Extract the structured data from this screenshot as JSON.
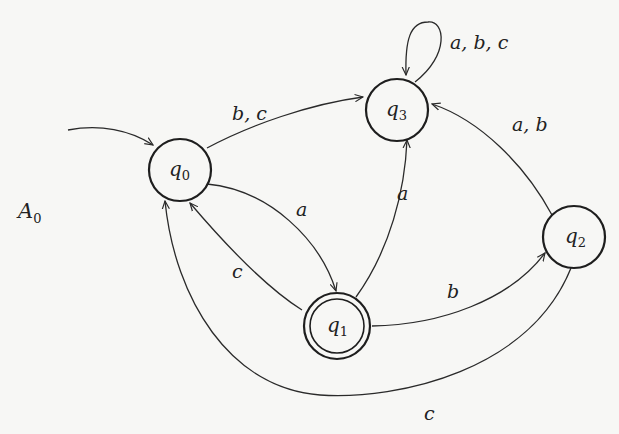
{
  "diagram": {
    "type": "finite-automaton",
    "name": "A",
    "name_subscript": "0",
    "alphabet": [
      "a",
      "b",
      "c"
    ],
    "states": [
      {
        "id": "q0",
        "base": "q",
        "sub": "0",
        "initial": true,
        "accepting": false
      },
      {
        "id": "q1",
        "base": "q",
        "sub": "1",
        "initial": false,
        "accepting": true
      },
      {
        "id": "q2",
        "base": "q",
        "sub": "2",
        "initial": false,
        "accepting": false
      },
      {
        "id": "q3",
        "base": "q",
        "sub": "3",
        "initial": false,
        "accepting": false
      }
    ],
    "transitions": [
      {
        "from": "q0",
        "to": "q3",
        "label": "b, c"
      },
      {
        "from": "q0",
        "to": "q1",
        "label": "a"
      },
      {
        "from": "q1",
        "to": "q0",
        "label": "c"
      },
      {
        "from": "q1",
        "to": "q3",
        "label": "a"
      },
      {
        "from": "q1",
        "to": "q2",
        "label": "b"
      },
      {
        "from": "q2",
        "to": "q3",
        "label": "a, b"
      },
      {
        "from": "q2",
        "to": "q0",
        "label": "c"
      },
      {
        "from": "q3",
        "to": "q3",
        "label": "a, b, c"
      }
    ]
  }
}
